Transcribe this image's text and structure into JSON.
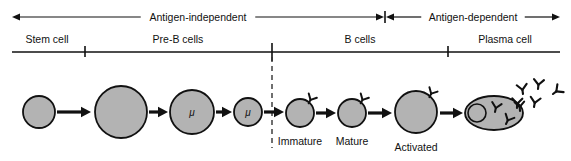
{
  "figure": {
    "width": 571,
    "height": 161,
    "background": "#ffffff",
    "ink_color": "#111111",
    "cell_fill": "#b3b3b3"
  },
  "phases": [
    {
      "id": "antigen-independent",
      "label": "Antigen-independent",
      "x_start": 12,
      "x_end": 384,
      "arrow_heads": "both"
    },
    {
      "id": "antigen-dependent",
      "label": "Antigen-dependent",
      "x_start": 386,
      "x_end": 560,
      "arrow_heads": "both"
    }
  ],
  "stages": [
    {
      "id": "stem-cell",
      "label": "Stem cell",
      "label_x": 47,
      "x_start": 12,
      "x_end": 85
    },
    {
      "id": "pre-b-cells",
      "label": "Pre-B cells",
      "label_x": 178,
      "x_start": 85,
      "x_end": 272
    },
    {
      "id": "b-cells",
      "label": "B cells",
      "label_x": 360,
      "x_start": 272,
      "x_end": 448
    },
    {
      "id": "plasma-cell",
      "label": "Plasma cell",
      "label_x": 505,
      "x_start": 448,
      "x_end": 560
    }
  ],
  "stage_ticks": [
    85,
    272,
    448
  ],
  "divider": {
    "id": "antigen-encounter-divider",
    "x": 272,
    "y_top": 57,
    "y_bottom": 148,
    "style": "dashed"
  },
  "baseline": {
    "y": 52,
    "x_start": 12,
    "x_end": 560
  },
  "phase_axis": {
    "y": 17
  },
  "cells": [
    {
      "id": "stem-cell-body",
      "shape": "circle",
      "cx": 39,
      "cy": 112,
      "r": 16,
      "marker": "",
      "receptors": 0,
      "label": ""
    },
    {
      "id": "pre-b-early",
      "shape": "circle",
      "cx": 121,
      "cy": 112,
      "r": 26,
      "marker": "",
      "receptors": 0,
      "label": ""
    },
    {
      "id": "pre-b-mu-large",
      "shape": "circle",
      "cx": 192,
      "cy": 112,
      "r": 22,
      "marker": "μ",
      "receptors": 0,
      "label": ""
    },
    {
      "id": "pre-b-mu-small",
      "shape": "circle",
      "cx": 248,
      "cy": 112,
      "r": 14,
      "marker": "μ",
      "receptors": 0,
      "label": ""
    },
    {
      "id": "immature-b-cell",
      "shape": "circle",
      "cx": 300,
      "cy": 113,
      "r": 14,
      "marker": "",
      "receptors": 1,
      "label": "Immature"
    },
    {
      "id": "mature-b-cell",
      "shape": "circle",
      "cx": 352,
      "cy": 113,
      "r": 14,
      "marker": "",
      "receptors": 1,
      "label": "Mature"
    },
    {
      "id": "activated-b-cell",
      "shape": "circle",
      "cx": 416,
      "cy": 112,
      "r": 21,
      "marker": "",
      "receptors": 1,
      "label": "Activated"
    }
  ],
  "plasma_cell": {
    "id": "plasma-cell-body",
    "shape": "ellipse",
    "cx": 494,
    "cy": 113,
    "rx": 29,
    "ry": 17,
    "nucleus": {
      "cx": 477,
      "cy": 113,
      "r": 9
    },
    "internal_antibodies": 2,
    "label": ""
  },
  "secreted_antibodies": {
    "id": "secreted-antibodies",
    "count": 5,
    "positions": [
      {
        "x": 523,
        "y": 94,
        "rot": -8
      },
      {
        "x": 538,
        "y": 89,
        "rot": 6
      },
      {
        "x": 553,
        "y": 94,
        "rot": 52
      },
      {
        "x": 517,
        "y": 108,
        "rot": 2
      },
      {
        "x": 534,
        "y": 107,
        "rot": 10
      }
    ]
  },
  "arrows": [
    {
      "id": "arrow-stem-to-preb",
      "x_start": 57,
      "x_end": 91,
      "y": 112
    },
    {
      "id": "arrow-preb-to-mu-large",
      "x_start": 149,
      "x_end": 168,
      "y": 112
    },
    {
      "id": "arrow-mu-large-to-mu-small",
      "x_start": 216,
      "x_end": 232,
      "y": 112
    },
    {
      "id": "arrow-mu-small-to-immature",
      "x_start": 264,
      "x_end": 284,
      "y": 112
    },
    {
      "id": "arrow-immature-to-mature",
      "x_start": 316,
      "x_end": 336,
      "y": 113
    },
    {
      "id": "arrow-mature-to-activated",
      "x_start": 368,
      "x_end": 392,
      "y": 113
    },
    {
      "id": "arrow-activated-to-plasma",
      "x_start": 440,
      "x_end": 463,
      "y": 113
    }
  ]
}
